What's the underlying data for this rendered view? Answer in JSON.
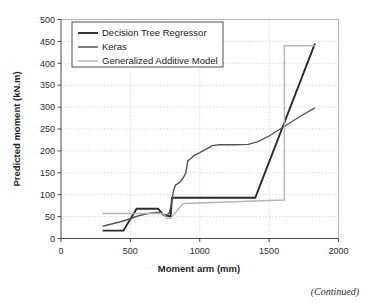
{
  "figure": {
    "continued_note": "(Continued)"
  },
  "chart_data": {
    "type": "line",
    "title": "",
    "xlabel": "Moment arm (mm)",
    "ylabel": "Predicted moment (kN.m)",
    "xlim": [
      0,
      2000
    ],
    "ylim": [
      0,
      500
    ],
    "xticks": [
      0,
      500,
      1000,
      1500,
      2000
    ],
    "yticks": [
      0,
      50,
      100,
      150,
      200,
      250,
      300,
      350,
      400,
      450,
      500
    ],
    "xtick_labels": [
      "0",
      "500",
      "1000",
      "1500",
      "2000"
    ],
    "ytick_labels": [
      "0",
      "50",
      "100",
      "150",
      "200",
      "250",
      "300",
      "350",
      "400",
      "450",
      "500"
    ],
    "grid": true,
    "grid_style": "dotted",
    "legend_position": "upper-left",
    "series": [
      {
        "name": "Decision Tree Regressor",
        "color": "#2b2b2b",
        "width": 1.9,
        "x": [
          300,
          450,
          450,
          545,
          545,
          610,
          610,
          700,
          700,
          740,
          740,
          755,
          755,
          790,
          790,
          800,
          800,
          1400,
          1400,
          1830
        ],
        "y": [
          18,
          18,
          18,
          68,
          68,
          68,
          68,
          68,
          68,
          53,
          53,
          53,
          53,
          50,
          50,
          93,
          93,
          93,
          93,
          445
        ]
      },
      {
        "name": "Keras",
        "color": "#555555",
        "width": 1.4,
        "x": [
          300,
          450,
          560,
          640,
          700,
          745,
          760,
          780,
          795,
          810,
          825,
          845,
          860,
          880,
          900,
          915,
          930,
          960,
          1000,
          1040,
          1090,
          1140,
          1250,
          1350,
          1420,
          1500,
          1580,
          1660,
          1740,
          1830
        ],
        "y": [
          28,
          40,
          52,
          58,
          60,
          55,
          52,
          58,
          78,
          108,
          122,
          126,
          130,
          138,
          150,
          178,
          181,
          190,
          196,
          203,
          212,
          214,
          214,
          215,
          221,
          234,
          250,
          266,
          282,
          298
        ]
      },
      {
        "name": "Generalized Additive Model",
        "color": "#b5b5b5",
        "width": 1.4,
        "x": [
          300,
          735,
          735,
          760,
          760,
          790,
          790,
          880,
          880,
          1610,
          1610,
          1830
        ],
        "y": [
          57,
          57,
          57,
          46,
          46,
          46,
          46,
          80,
          80,
          88,
          440,
          440
        ]
      }
    ]
  }
}
